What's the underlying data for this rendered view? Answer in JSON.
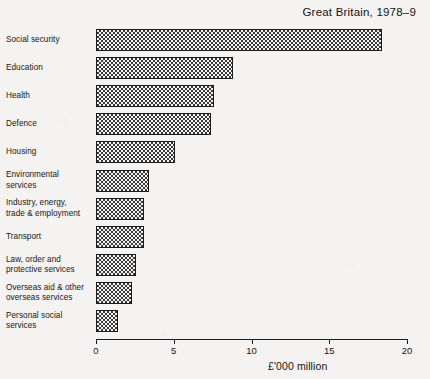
{
  "chart_data": {
    "type": "bar",
    "orientation": "horizontal",
    "title": "Great Britain, 1978–9",
    "xlabel": "£'000 million",
    "ylabel": "",
    "xlim": [
      0,
      20
    ],
    "xticks": [
      0,
      5,
      10,
      15,
      20
    ],
    "xtick_labels": [
      "0",
      "5",
      "10",
      "15",
      "20"
    ],
    "grid": false,
    "legend": null,
    "categories": [
      "Social security",
      "Education",
      "Health",
      "Defence",
      "Housing",
      "Environmental services",
      "Industry, energy, trade & employment",
      "Transport",
      "Law, order and protective services",
      "Overseas aid & other overseas services",
      "Personal social services"
    ],
    "values": [
      18.4,
      8.8,
      7.6,
      7.4,
      5.1,
      3.4,
      3.1,
      3.1,
      2.6,
      2.3,
      1.4
    ],
    "bar_fill": "checkerboard-hatch",
    "bar_border_color": "#1a1a1a",
    "background_color": "#f4f3f1"
  },
  "labels": [
    {
      "lines": [
        "Social security"
      ]
    },
    {
      "lines": [
        "Education"
      ]
    },
    {
      "lines": [
        "Health"
      ]
    },
    {
      "lines": [
        "Defence"
      ]
    },
    {
      "lines": [
        "Housing"
      ]
    },
    {
      "lines": [
        "Environmental",
        "services"
      ]
    },
    {
      "lines": [
        "Industry, energy,",
        "trade & employment"
      ]
    },
    {
      "lines": [
        "Transport"
      ]
    },
    {
      "lines": [
        "Law, order and",
        "protective services"
      ]
    },
    {
      "lines": [
        "Overseas aid & other",
        "overseas services"
      ]
    },
    {
      "lines": [
        "Personal social",
        "services"
      ]
    }
  ]
}
